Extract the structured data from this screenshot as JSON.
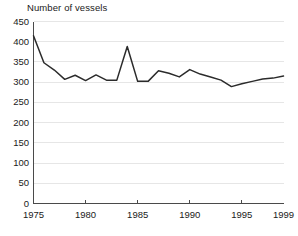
{
  "chart_data": {
    "type": "line",
    "title": "Number of vessels",
    "xlabel": "",
    "ylabel": "",
    "xlim": [
      1975,
      1999
    ],
    "ylim": [
      0,
      450
    ],
    "grid": true,
    "legend": false,
    "y_ticks": [
      0,
      50,
      100,
      150,
      200,
      250,
      300,
      350,
      400,
      450
    ],
    "y_tick_labels": [
      "0",
      "50",
      "100",
      "150",
      "200",
      "250",
      "300",
      "350",
      "400",
      "450"
    ],
    "x_ticks": [
      1975,
      1980,
      1985,
      1990,
      1995,
      1999
    ],
    "x_tick_labels": [
      "1975",
      "1980",
      "1985",
      "1990",
      "1995",
      "1999"
    ],
    "x": [
      1975,
      1976,
      1977,
      1978,
      1979,
      1980,
      1981,
      1982,
      1983,
      1984,
      1985,
      1986,
      1987,
      1988,
      1989,
      1990,
      1991,
      1992,
      1993,
      1994,
      1995,
      1996,
      1997,
      1998,
      1999
    ],
    "values": [
      415,
      348,
      330,
      307,
      317,
      304,
      318,
      305,
      305,
      388,
      302,
      302,
      328,
      322,
      313,
      331,
      320,
      313,
      305,
      289,
      296,
      302,
      308,
      310,
      315
    ],
    "series": [
      {
        "name": "Number of vessels",
        "color": "#2b2b2b",
        "values": [
          415,
          348,
          330,
          307,
          317,
          304,
          318,
          305,
          305,
          388,
          302,
          302,
          328,
          322,
          313,
          331,
          320,
          313,
          305,
          289,
          296,
          302,
          308,
          310,
          315
        ]
      }
    ],
    "colors": {
      "line": "#2b2b2b",
      "grid": "#e6e6e6",
      "axis": "#4a4a4a",
      "text": "#1a1a1a",
      "background": "#ffffff"
    }
  }
}
